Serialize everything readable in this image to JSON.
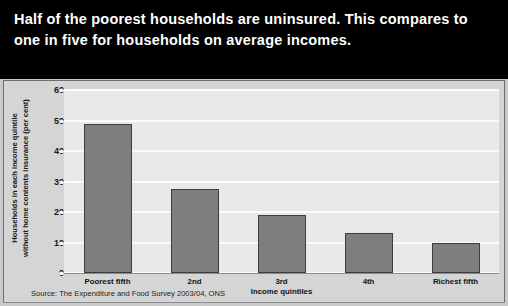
{
  "headline": "Half of the poorest households are uninsured.  This compares to one in five for households on average incomes.",
  "source_note": "Source: The Expenditure and Food Survey 2003/04, ONS",
  "colors": {
    "band_background": "#000000",
    "headline_text": "#ffffff",
    "page_background": "#c9c9c9",
    "chart_background": "#d5d5d5",
    "plot_background": "#e9e9e9",
    "gridline": "#fbfbfb",
    "bar_fill": "#7e7e7e",
    "bar_border": "#3d3d3d",
    "axis_text": "#111111"
  },
  "chart_data": {
    "type": "bar",
    "title": "",
    "xlabel": "Income quintiles",
    "ylabel": "Households in each income quintile without home contents insurance (per cent)",
    "ylabel_lines": "Households in each income quintile\nwithout home contents insurance (per cent)",
    "categories": [
      "Poorest fifth",
      "2nd",
      "3rd",
      "4th",
      "Richest fifth"
    ],
    "values": [
      48.8,
      27.5,
      19.0,
      13.2,
      9.9
    ],
    "ylim": [
      0,
      60
    ],
    "yticks": [
      0,
      10,
      20,
      30,
      40,
      50,
      60
    ],
    "ytick_labels": [
      "0",
      "10",
      "20",
      "30",
      "40",
      "50",
      "60"
    ],
    "grid": true,
    "legend": false,
    "legend_position": "none"
  }
}
